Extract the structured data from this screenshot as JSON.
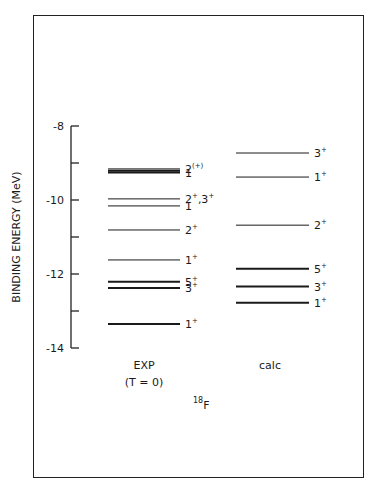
{
  "chart_data": {
    "type": "level-diagram",
    "title": "18F",
    "nucleus": {
      "mass_number": "18",
      "symbol": "F"
    },
    "ylabel": "BINDING ENERGY (MeV)",
    "ylim": [
      -14,
      -8
    ],
    "yticks": [
      -8,
      -9,
      -10,
      -11,
      -12,
      -13,
      -14
    ],
    "ytick_labels": [
      "-8",
      "",
      "-10",
      "",
      "-12",
      "",
      "-14"
    ],
    "columns": [
      {
        "name": "EXP",
        "subtitle": "(T = 0)",
        "levels": [
          {
            "energy": -9.16,
            "label": "2",
            "sup": "(+)",
            "thick": false
          },
          {
            "energy": -9.21,
            "label": "",
            "sup": "",
            "thick": true
          },
          {
            "energy": -9.26,
            "label": "1",
            "sup": "",
            "thick": true
          },
          {
            "energy": -9.97,
            "label": "2",
            "sup": "+",
            "label2": ",3",
            "sup2": "+",
            "thick": false
          },
          {
            "energy": -10.16,
            "label": "1",
            "sup": "",
            "thick": false
          },
          {
            "energy": -10.81,
            "label": "2",
            "sup": "+",
            "thick": false
          },
          {
            "energy": -11.62,
            "label": "1",
            "sup": "+",
            "thick": false
          },
          {
            "energy": -12.21,
            "label": "5",
            "sup": "+",
            "thick": true
          },
          {
            "energy": -12.38,
            "label": "3",
            "sup": "+",
            "thick": true
          },
          {
            "energy": -13.35,
            "label": "1",
            "sup": "+",
            "thick": true
          }
        ]
      },
      {
        "name": "calc",
        "subtitle": "",
        "levels": [
          {
            "energy": -8.73,
            "label": "3",
            "sup": "+",
            "thick": false
          },
          {
            "energy": -9.38,
            "label": "1",
            "sup": "+",
            "thick": false
          },
          {
            "energy": -10.68,
            "label": "2",
            "sup": "+",
            "thick": false
          },
          {
            "energy": -11.86,
            "label": "5",
            "sup": "+",
            "thick": true
          },
          {
            "energy": -12.34,
            "label": "3",
            "sup": "+",
            "thick": true
          },
          {
            "energy": -12.78,
            "label": "1",
            "sup": "+",
            "thick": true
          }
        ]
      }
    ],
    "grid": false,
    "legend": null
  }
}
